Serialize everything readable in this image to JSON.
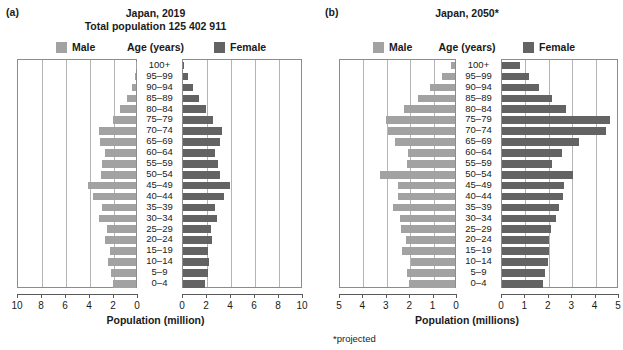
{
  "figure": {
    "background": "#ffffff",
    "male_color": "#a2a2a2",
    "female_color": "#636363",
    "frame_color": "#8c8c8c",
    "grid_color": "#b4b4b4"
  },
  "panels": [
    {
      "letter": "(a)",
      "title": "Japan, 2019",
      "subtitle": "Total population 125 402 911",
      "legend": {
        "male_label": "Male",
        "center_label": "Age (years)",
        "female_label": "Female"
      },
      "axis_title": "Population (million)",
      "footnote": "",
      "chart_data": {
        "type": "bar",
        "subtype": "population-pyramid",
        "title": "Japan, 2019",
        "subtitle": "Total population 125 402 911",
        "xlabel": "Population (million)",
        "ylabel": "Age (years)",
        "xlim": [
          0,
          10
        ],
        "xticks": [
          10,
          8,
          6,
          4,
          2,
          0,
          0,
          2,
          4,
          6,
          8,
          10
        ],
        "xticks_left": [
          10,
          8,
          6,
          4,
          2,
          0
        ],
        "xticks_right": [
          0,
          2,
          4,
          6,
          8,
          10
        ],
        "grid": true,
        "legend_position": "top",
        "categories": [
          "100+",
          "95–99",
          "90–94",
          "85–89",
          "80–84",
          "75–79",
          "70–74",
          "65–69",
          "60–64",
          "55–59",
          "50–54",
          "45–49",
          "40–44",
          "35–39",
          "30–34",
          "25–29",
          "20–24",
          "15–19",
          "10–14",
          "5–9",
          "0–4"
        ],
        "series": [
          {
            "name": "Male",
            "color": "#a2a2a2",
            "side": "left",
            "values": [
              0.01,
              0.12,
              0.37,
              0.76,
              1.33,
              1.95,
              3.05,
              3.0,
              2.55,
              2.85,
              2.9,
              4.0,
              3.55,
              2.8,
              3.05,
              2.45,
              2.55,
              2.2,
              2.3,
              2.1,
              1.9
            ]
          },
          {
            "name": "Female",
            "color": "#636363",
            "side": "right",
            "values": [
              0.07,
              0.38,
              0.86,
              1.37,
              1.95,
              2.5,
              3.25,
              3.1,
              2.65,
              2.95,
              3.1,
              3.9,
              3.4,
              2.7,
              2.85,
              2.35,
              2.4,
              2.1,
              2.15,
              2.05,
              1.8
            ]
          }
        ]
      }
    },
    {
      "letter": "(b)",
      "title": "Japan, 2050*",
      "subtitle": "",
      "legend": {
        "male_label": "Male",
        "center_label": "Age (years)",
        "female_label": "Female"
      },
      "axis_title": "Population (millions)",
      "footnote": "*projected",
      "chart_data": {
        "type": "bar",
        "subtype": "population-pyramid",
        "title": "Japan, 2050*",
        "subtitle": "",
        "xlabel": "Population (millions)",
        "ylabel": "Age (years)",
        "xlim": [
          0,
          5
        ],
        "xticks": [
          5,
          4,
          3,
          2,
          1,
          0,
          0,
          1,
          2,
          3,
          4,
          5
        ],
        "xticks_left": [
          5,
          4,
          3,
          2,
          1,
          0
        ],
        "xticks_right": [
          0,
          1,
          2,
          3,
          4,
          5
        ],
        "grid": true,
        "legend_position": "top",
        "annotation": "*projected",
        "categories": [
          "100+",
          "95–99",
          "90–94",
          "85–89",
          "80–84",
          "75–79",
          "70–74",
          "65–69",
          "60–64",
          "55–59",
          "50–54",
          "45–49",
          "40–44",
          "35–39",
          "30–34",
          "25–29",
          "20–24",
          "15–19",
          "10–14",
          "5–9",
          "0–4"
        ],
        "series": [
          {
            "name": "Male",
            "color": "#a2a2a2",
            "side": "left",
            "values": [
              0.16,
              0.55,
              1.05,
              1.6,
              2.2,
              2.95,
              2.85,
              2.55,
              2.0,
              2.05,
              3.2,
              2.45,
              2.45,
              2.65,
              2.35,
              2.3,
              2.1,
              2.25,
              1.9,
              2.05,
              1.95
            ]
          },
          {
            "name": "Female",
            "color": "#636363",
            "side": "right",
            "values": [
              0.75,
              1.15,
              1.6,
              2.15,
              2.75,
              4.6,
              4.45,
              3.3,
              2.55,
              2.15,
              3.05,
              2.65,
              2.6,
              2.45,
              2.3,
              2.1,
              2.0,
              2.0,
              1.95,
              1.85,
              1.75
            ]
          }
        ]
      }
    }
  ]
}
